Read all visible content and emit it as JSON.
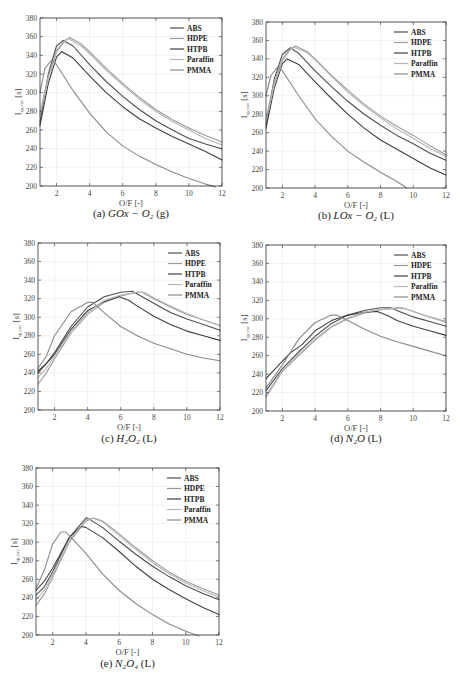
{
  "figure": {
    "y_label": "I_sp,vac [s]",
    "x_label": "O/F [-]",
    "legend": [
      "ABS",
      "HDPE",
      "HTPB",
      "Paraffin",
      "PMMA"
    ],
    "series_colors": {
      "ABS": "#4d4d4d",
      "HDPE": "#9a9a9a",
      "HTPB": "#3f3f3f",
      "Paraffin": "#b5b5b5",
      "PMMA": "#8a8a8a"
    }
  },
  "chart_data": [
    {
      "id": "a",
      "type": "line",
      "caption_prefix": "(a)",
      "caption_math": "GOx − O₂",
      "caption_suffix": "(g)",
      "xlabel": "O/F [-]",
      "ylabel": "I_sp,vac [s]",
      "xlim": [
        1,
        12
      ],
      "ylim": [
        200,
        380
      ],
      "xticks": [
        2,
        4,
        6,
        8,
        10,
        12
      ],
      "yticks": [
        200,
        220,
        240,
        260,
        280,
        300,
        320,
        340,
        360,
        380
      ],
      "grid": true,
      "legend_position": "upper right",
      "series": [
        {
          "name": "ABS",
          "x": [
            1,
            1.5,
            2,
            2.4,
            3,
            4,
            5,
            6,
            7,
            8,
            9,
            10,
            11,
            12
          ],
          "y": [
            268,
            320,
            350,
            356,
            350,
            330,
            312,
            296,
            282,
            270,
            260,
            251,
            245,
            240
          ]
        },
        {
          "name": "HDPE",
          "x": [
            1,
            1.5,
            2,
            2.5,
            2.8,
            3.5,
            4,
            5,
            6,
            7,
            8,
            9,
            10,
            11,
            12
          ],
          "y": [
            278,
            318,
            345,
            356,
            359,
            352,
            344,
            326,
            310,
            295,
            282,
            271,
            262,
            254,
            247
          ]
        },
        {
          "name": "HTPB",
          "x": [
            1,
            1.5,
            2,
            2.3,
            3,
            4,
            5,
            6,
            7,
            8,
            9,
            10,
            11,
            12
          ],
          "y": [
            265,
            310,
            338,
            344,
            337,
            318,
            300,
            285,
            272,
            262,
            253,
            245,
            237,
            228
          ]
        },
        {
          "name": "Paraffin",
          "x": [
            1,
            1.5,
            2,
            2.5,
            2.7,
            3.5,
            4,
            5,
            6,
            7,
            8,
            9,
            10,
            11,
            12
          ],
          "y": [
            275,
            315,
            343,
            355,
            358,
            350,
            342,
            324,
            308,
            293,
            280,
            269,
            260,
            251,
            244
          ]
        },
        {
          "name": "PMMA",
          "x": [
            1,
            1.3,
            1.7,
            2,
            3,
            4,
            5,
            6,
            7,
            8,
            9,
            10,
            11,
            11.6
          ],
          "y": [
            300,
            326,
            335,
            330,
            302,
            278,
            258,
            243,
            232,
            223,
            215,
            208,
            202,
            199
          ]
        }
      ]
    },
    {
      "id": "b",
      "type": "line",
      "caption_prefix": "(b)",
      "caption_math": "LOx − O₂",
      "caption_suffix": "(L)",
      "xlabel": "O/F [-]",
      "ylabel": "I_sp,vac [s]",
      "xlim": [
        1,
        12
      ],
      "ylim": [
        200,
        380
      ],
      "xticks": [
        2,
        4,
        6,
        8,
        10,
        12
      ],
      "yticks": [
        200,
        220,
        240,
        260,
        280,
        300,
        320,
        340,
        360,
        380
      ],
      "grid": true,
      "legend_position": "upper right",
      "series": [
        {
          "name": "ABS",
          "x": [
            1,
            1.5,
            2,
            2.5,
            3,
            4,
            5,
            6,
            7,
            8,
            9,
            10,
            11,
            12
          ],
          "y": [
            268,
            318,
            345,
            352,
            346,
            327,
            310,
            294,
            280,
            268,
            257,
            248,
            238,
            230
          ]
        },
        {
          "name": "HDPE",
          "x": [
            1,
            1.5,
            2,
            2.5,
            2.8,
            3.5,
            4,
            5,
            6,
            7,
            8,
            9,
            10,
            11,
            12
          ],
          "y": [
            275,
            315,
            340,
            351,
            354,
            348,
            340,
            322,
            306,
            291,
            278,
            267,
            257,
            246,
            236
          ]
        },
        {
          "name": "HTPB",
          "x": [
            1,
            1.5,
            2,
            2.3,
            3,
            4,
            5,
            6,
            7,
            8,
            9,
            10,
            11,
            12
          ],
          "y": [
            265,
            308,
            335,
            340,
            334,
            315,
            297,
            280,
            265,
            252,
            242,
            232,
            222,
            214
          ]
        },
        {
          "name": "Paraffin",
          "x": [
            1,
            1.5,
            2,
            2.5,
            2.7,
            3.5,
            4,
            5,
            6,
            7,
            8,
            9,
            10,
            11,
            12
          ],
          "y": [
            272,
            312,
            338,
            350,
            353,
            347,
            339,
            321,
            304,
            289,
            276,
            264,
            254,
            243,
            234
          ]
        },
        {
          "name": "PMMA",
          "x": [
            1,
            1.3,
            1.7,
            2,
            3,
            4,
            5,
            6,
            7,
            8,
            9,
            9.6
          ],
          "y": [
            300,
            322,
            331,
            327,
            300,
            275,
            256,
            240,
            228,
            217,
            207,
            200
          ]
        }
      ]
    },
    {
      "id": "c",
      "type": "line",
      "caption_prefix": "(c)",
      "caption_math": "H₂O₂",
      "caption_suffix": "(L)",
      "xlabel": "O/F [-]",
      "ylabel": "I_sp,vac [s]",
      "xlim": [
        1,
        12
      ],
      "ylim": [
        200,
        380
      ],
      "xticks": [
        2,
        4,
        6,
        8,
        10,
        12
      ],
      "yticks": [
        200,
        220,
        240,
        260,
        280,
        300,
        320,
        340,
        360,
        380
      ],
      "grid": true,
      "legend_position": "upper right",
      "series": [
        {
          "name": "ABS",
          "x": [
            1,
            1.5,
            2,
            3,
            4,
            5,
            6,
            6.7,
            7,
            8,
            9,
            10,
            11,
            12
          ],
          "y": [
            240,
            250,
            262,
            290,
            311,
            322,
            327,
            328,
            325,
            315,
            305,
            298,
            292,
            286
          ]
        },
        {
          "name": "HDPE",
          "x": [
            1,
            1.5,
            2,
            3,
            4,
            5,
            6,
            7,
            7.3,
            8,
            9,
            10,
            11,
            12
          ],
          "y": [
            228,
            240,
            255,
            283,
            303,
            316,
            323,
            327,
            327,
            320,
            311,
            303,
            297,
            291
          ]
        },
        {
          "name": "HTPB",
          "x": [
            1,
            1.5,
            2,
            3,
            4,
            5,
            5.9,
            6.5,
            7,
            8,
            9,
            10,
            11,
            12
          ],
          "y": [
            242,
            250,
            260,
            287,
            307,
            317,
            322,
            318,
            312,
            301,
            292,
            285,
            280,
            275
          ]
        },
        {
          "name": "Paraffin",
          "x": [
            1,
            1.5,
            2,
            3,
            4,
            5,
            6,
            7,
            7.4,
            8,
            9,
            10,
            11,
            12
          ],
          "y": [
            235,
            245,
            258,
            285,
            305,
            318,
            324,
            327,
            327,
            321,
            312,
            304,
            297,
            291
          ]
        },
        {
          "name": "PMMA",
          "x": [
            1,
            1.5,
            2,
            3,
            4,
            4.3,
            5,
            6,
            7,
            8,
            9,
            10,
            11,
            12
          ],
          "y": [
            245,
            258,
            280,
            306,
            316,
            316,
            305,
            290,
            280,
            272,
            266,
            260,
            256,
            253
          ]
        }
      ]
    },
    {
      "id": "d",
      "type": "line",
      "caption_prefix": "(d)",
      "caption_math": "N₂O",
      "caption_suffix": "(L)",
      "xlabel": "O/F [-]",
      "ylabel": "I_sp,vac [s]",
      "xlim": [
        1,
        12
      ],
      "ylim": [
        200,
        380
      ],
      "xticks": [
        2,
        4,
        6,
        8,
        10,
        12
      ],
      "yticks": [
        200,
        220,
        240,
        260,
        280,
        300,
        320,
        340,
        360,
        380
      ],
      "grid": true,
      "legend_position": "upper right",
      "series": [
        {
          "name": "ABS",
          "x": [
            1,
            2,
            3,
            4,
            5,
            6,
            7,
            8,
            8.6,
            9,
            10,
            11,
            12
          ],
          "y": [
            222,
            246,
            264,
            281,
            295,
            304,
            309,
            312,
            312,
            309,
            302,
            297,
            292
          ]
        },
        {
          "name": "HDPE",
          "x": [
            1,
            2,
            3,
            4,
            5,
            6,
            7,
            8,
            9,
            9.3,
            10,
            11,
            12
          ],
          "y": [
            215,
            243,
            260,
            277,
            291,
            300,
            306,
            310,
            312,
            312,
            308,
            302,
            297
          ]
        },
        {
          "name": "HTPB",
          "x": [
            1,
            2,
            2.5,
            3.2,
            4,
            5,
            6,
            7,
            7.8,
            8.5,
            9,
            10,
            11,
            12
          ],
          "y": [
            235,
            254,
            263,
            272,
            287,
            298,
            304,
            307,
            308,
            303,
            298,
            292,
            287,
            282
          ]
        },
        {
          "name": "Paraffin",
          "x": [
            1,
            2,
            3,
            4,
            5,
            6,
            7,
            8,
            9,
            9.5,
            10,
            11,
            12
          ],
          "y": [
            217,
            244,
            261,
            278,
            292,
            301,
            307,
            310,
            311,
            311,
            308,
            302,
            296
          ]
        },
        {
          "name": "PMMA",
          "x": [
            1,
            2,
            3,
            4,
            5,
            5.3,
            6,
            7,
            8,
            9,
            10,
            11,
            12
          ],
          "y": [
            225,
            250,
            278,
            296,
            304,
            304,
            298,
            289,
            281,
            275,
            270,
            265,
            260
          ]
        }
      ]
    },
    {
      "id": "e",
      "type": "line",
      "caption_prefix": "(e)",
      "caption_math": "N₂O₄",
      "caption_suffix": "(L)",
      "xlabel": "O/F [-]",
      "ylabel": "I_sp,vac [s]",
      "xlim": [
        1,
        12
      ],
      "ylim": [
        200,
        380
      ],
      "xticks": [
        2,
        4,
        6,
        8,
        10,
        12
      ],
      "yticks": [
        200,
        220,
        240,
        260,
        280,
        300,
        320,
        340,
        360,
        380
      ],
      "grid": true,
      "legend_position": "upper right",
      "series": [
        {
          "name": "ABS",
          "x": [
            1,
            1.5,
            2,
            3,
            4,
            4.1,
            5,
            6,
            7,
            8,
            9,
            10,
            11,
            12
          ],
          "y": [
            243,
            252,
            268,
            305,
            326,
            326,
            316,
            301,
            287,
            274,
            263,
            253,
            245,
            238
          ]
        },
        {
          "name": "HDPE",
          "x": [
            1,
            1.5,
            2,
            3,
            4,
            4.5,
            5,
            6,
            7,
            8,
            9,
            10,
            11,
            12
          ],
          "y": [
            232,
            244,
            262,
            300,
            323,
            326,
            323,
            309,
            294,
            280,
            268,
            258,
            250,
            243
          ]
        },
        {
          "name": "HTPB",
          "x": [
            1,
            1.5,
            2,
            3,
            3.7,
            4,
            5,
            6,
            7,
            8,
            9,
            10,
            11,
            12
          ],
          "y": [
            248,
            258,
            272,
            305,
            317,
            316,
            305,
            290,
            274,
            260,
            249,
            239,
            230,
            222
          ]
        },
        {
          "name": "Paraffin",
          "x": [
            1,
            1.5,
            2,
            3,
            4,
            4.4,
            5,
            6,
            7,
            8,
            9,
            10,
            11,
            12
          ],
          "y": [
            238,
            248,
            265,
            302,
            324,
            326,
            322,
            307,
            292,
            278,
            266,
            256,
            248,
            241
          ]
        },
        {
          "name": "PMMA",
          "x": [
            1,
            1.5,
            2,
            2.5,
            2.8,
            3,
            4,
            5,
            6,
            7,
            8,
            9,
            10,
            10.8
          ],
          "y": [
            250,
            270,
            298,
            311,
            311,
            307,
            288,
            266,
            248,
            234,
            222,
            212,
            204,
            199
          ]
        }
      ]
    }
  ]
}
